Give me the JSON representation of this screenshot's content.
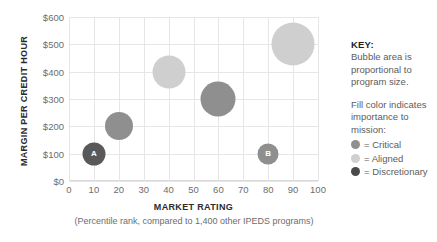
{
  "chart_data": {
    "type": "scatter",
    "title": "",
    "xlabel": "MARKET RATING",
    "xsublabel": "(Percentile rank, compared to 1,400 other IPEDS programs)",
    "ylabel": "MARGIN PER CREDIT HOUR",
    "xlim": [
      0,
      100
    ],
    "ylim": [
      0,
      600
    ],
    "xticks": [
      "0",
      "10",
      "20",
      "30",
      "40",
      "50",
      "60",
      "70",
      "80",
      "90",
      "100"
    ],
    "xtick_values": [
      0,
      10,
      20,
      30,
      40,
      50,
      60,
      70,
      80,
      90,
      100
    ],
    "yticks": [
      "$0",
      "$100",
      "$200",
      "$300",
      "$400",
      "$500",
      "$600"
    ],
    "ytick_values": [
      0,
      100,
      200,
      300,
      400,
      500,
      600
    ],
    "grid": true,
    "legend_position": "right",
    "points": [
      {
        "label": "A",
        "x": 10,
        "y": 100,
        "r": 11.5,
        "category": "Discretionary",
        "color": "#595959"
      },
      {
        "label": "",
        "x": 20,
        "y": 200,
        "r": 14.0,
        "category": "Critical",
        "color": "#8f8f8f"
      },
      {
        "label": "",
        "x": 40,
        "y": 400,
        "r": 16.5,
        "category": "Aligned",
        "color": "#cfcfcf"
      },
      {
        "label": "",
        "x": 60,
        "y": 300,
        "r": 17.5,
        "category": "Critical",
        "color": "#8f8f8f"
      },
      {
        "label": "B",
        "x": 80,
        "y": 100,
        "r": 10.5,
        "category": "Critical",
        "color": "#8f8f8f"
      },
      {
        "label": "",
        "x": 90,
        "y": 500,
        "r": 21.5,
        "category": "Aligned",
        "color": "#cfcfcf"
      }
    ]
  },
  "key": {
    "title": "KEY:",
    "note_size": "Bubble area is proportional to program size.",
    "note_color": "Fill color indicates importance to mission:",
    "items": [
      {
        "label": "= Critical",
        "color": "#8f8f8f"
      },
      {
        "label": "= Aligned",
        "color": "#cfcfcf"
      },
      {
        "label": "= Discretionary",
        "color": "#4a4a4a"
      }
    ]
  },
  "colors": {
    "critical": "#8f8f8f",
    "aligned": "#cfcfcf",
    "discretionary": "#4a4a4a",
    "grid": "#e6e6e6",
    "text": "#5c5c5c",
    "axis_title": "#2b2b2b"
  }
}
